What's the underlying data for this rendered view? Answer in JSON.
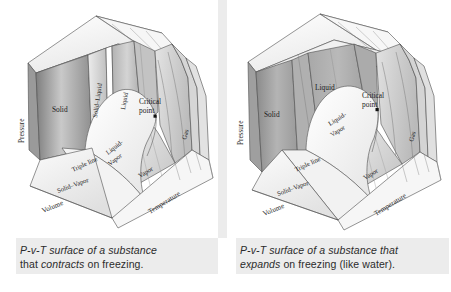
{
  "figure": {
    "type": "diagram",
    "background_color": "#ffffff",
    "band_color": "#ececec",
    "line_color": "#555555"
  },
  "panels": [
    {
      "id": "contracts",
      "caption_line1": "P-v-T surface of a substance",
      "caption_line2_pre": "that ",
      "caption_line2_em": "contracts",
      "caption_line2_post": " on freezing.",
      "axes": {
        "pressure": "Pressure",
        "volume": "Volume",
        "temperature": "Temperature"
      },
      "regions": [
        {
          "name": "solid",
          "label": "Solid"
        },
        {
          "name": "solid-liquid",
          "label": "Solid–Liquid"
        },
        {
          "name": "liquid",
          "label": "Liquid"
        },
        {
          "name": "liquid-vapor",
          "label": "Liquid-",
          "label2": "Vapor"
        },
        {
          "name": "vapor",
          "label": "Vapor"
        },
        {
          "name": "gas",
          "label": "Gas"
        },
        {
          "name": "solid-vapor",
          "label": "Solid–Vapor"
        },
        {
          "name": "triple-line",
          "label": "Triple line"
        }
      ],
      "annotations": [
        {
          "name": "critical-point",
          "label_line1": "Critical",
          "label_line2": "point"
        }
      ]
    },
    {
      "id": "expands",
      "caption_line1": "P-v-T surface of a substance that",
      "caption_line2_em": "expands",
      "caption_line2_post": " on freezing (like water).",
      "axes": {
        "pressure": "Pressure",
        "volume": "Volume",
        "temperature": "Temperature"
      },
      "regions": [
        {
          "name": "solid",
          "label": "Solid"
        },
        {
          "name": "liquid",
          "label": "Liquid"
        },
        {
          "name": "liquid-vapor",
          "label": "Liquid-",
          "label2": "Vapor"
        },
        {
          "name": "vapor",
          "label": "Vapor"
        },
        {
          "name": "gas",
          "label": "Gas"
        },
        {
          "name": "solid-vapor",
          "label": "Solid–Vapor"
        },
        {
          "name": "triple-line",
          "label": "Triple line"
        }
      ],
      "annotations": [
        {
          "name": "critical-point",
          "label_line1": "Critical",
          "label_line2": "point"
        }
      ]
    }
  ]
}
